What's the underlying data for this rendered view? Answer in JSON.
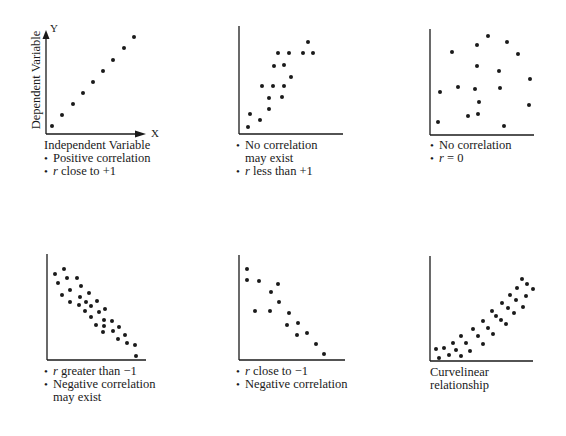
{
  "chart_data": [
    {
      "id": "positive",
      "type": "scatter",
      "title": "",
      "xlabel": "Independent Variable",
      "ylabel": "Dependent Variable",
      "x_axis_letter": "X",
      "y_axis_letter": "Y",
      "arrows": true,
      "grid": false,
      "axes": {
        "origin": [
          46,
          134
        ],
        "top": 30,
        "right": 146
      },
      "points": [
        [
          52,
          126
        ],
        [
          62,
          115
        ],
        [
          73,
          104
        ],
        [
          83,
          93
        ],
        [
          93,
          82
        ],
        [
          103,
          71
        ],
        [
          113,
          60
        ],
        [
          124,
          48
        ],
        [
          134,
          37
        ]
      ],
      "caption": [
        {
          "text": "Independent Variable",
          "bullet": false
        },
        {
          "text": "Positive correlation",
          "bullet": true
        },
        {
          "prefix": "r",
          "text": " close to +1",
          "bullet": true
        }
      ],
      "caption_pos": [
        44,
        139
      ]
    },
    {
      "id": "weak-positive",
      "type": "scatter",
      "title": "",
      "grid": false,
      "axes": {
        "origin": [
          239,
          134
        ],
        "top": 26,
        "right": 343
      },
      "points": [
        [
          248,
          127
        ],
        [
          250,
          114
        ],
        [
          260,
          120
        ],
        [
          269,
          109
        ],
        [
          269,
          98
        ],
        [
          262,
          86
        ],
        [
          273,
          86
        ],
        [
          282,
          97
        ],
        [
          284,
          86
        ],
        [
          291,
          77
        ],
        [
          274,
          66
        ],
        [
          284,
          65
        ],
        [
          278,
          53
        ],
        [
          289,
          53
        ],
        [
          303,
          53
        ],
        [
          313,
          53
        ],
        [
          308,
          42
        ]
      ],
      "caption": [
        {
          "text": "No correlation",
          "bullet": true
        },
        {
          "text": "may exist",
          "bullet": false,
          "indent": true
        },
        {
          "prefix": "r",
          "text": " less than +1",
          "bullet": true
        }
      ],
      "caption_pos": [
        236,
        139
      ]
    },
    {
      "id": "no-correlation",
      "type": "scatter",
      "title": "",
      "grid": false,
      "axes": {
        "origin": [
          430,
          135
        ],
        "top": 29,
        "right": 534
      },
      "points": [
        [
          488,
          36
        ],
        [
          507,
          42
        ],
        [
          477,
          45
        ],
        [
          452,
          52
        ],
        [
          518,
          54
        ],
        [
          477,
          66
        ],
        [
          499,
          71
        ],
        [
          530,
          79
        ],
        [
          440,
          92
        ],
        [
          458,
          87
        ],
        [
          475,
          89
        ],
        [
          500,
          88
        ],
        [
          479,
          102
        ],
        [
          529,
          105
        ],
        [
          468,
          116
        ],
        [
          478,
          114
        ],
        [
          438,
          122
        ],
        [
          504,
          126
        ]
      ],
      "caption": [
        {
          "text": "No correlation",
          "bullet": true
        },
        {
          "prefix": "r",
          "text": " = 0",
          "bullet": true
        }
      ],
      "caption_pos": [
        430,
        139
      ]
    },
    {
      "id": "weak-negative",
      "type": "scatter",
      "title": "",
      "grid": false,
      "axes": {
        "origin": [
          47,
          360
        ],
        "top": 254,
        "right": 146
      },
      "points": [
        [
          55,
          274
        ],
        [
          64,
          269
        ],
        [
          58,
          283
        ],
        [
          67,
          278
        ],
        [
          77,
          278
        ],
        [
          62,
          295
        ],
        [
          70,
          290
        ],
        [
          81,
          286
        ],
        [
          70,
          302
        ],
        [
          80,
          297
        ],
        [
          89,
          293
        ],
        [
          79,
          305
        ],
        [
          86,
          302
        ],
        [
          97,
          301
        ],
        [
          85,
          311
        ],
        [
          91,
          306
        ],
        [
          99,
          312
        ],
        [
          105,
          309
        ],
        [
          91,
          317
        ],
        [
          104,
          320
        ],
        [
          112,
          321
        ],
        [
          96,
          325
        ],
        [
          104,
          326
        ],
        [
          119,
          327
        ],
        [
          103,
          332
        ],
        [
          113,
          331
        ],
        [
          125,
          335
        ],
        [
          118,
          339
        ],
        [
          127,
          343
        ],
        [
          135,
          345
        ],
        [
          136,
          356
        ]
      ],
      "caption": [
        {
          "prefix": "r",
          "text": " greater than −1",
          "bullet": true
        },
        {
          "text": "Negative correlation",
          "bullet": true
        },
        {
          "text": "may exist",
          "bullet": false,
          "indent": true
        }
      ],
      "caption_pos": [
        44,
        365
      ]
    },
    {
      "id": "strong-negative",
      "type": "scatter",
      "title": "",
      "grid": false,
      "axes": {
        "origin": [
          239,
          360
        ],
        "top": 255,
        "right": 345
      },
      "points": [
        [
          247,
          269
        ],
        [
          247,
          280
        ],
        [
          259,
          281
        ],
        [
          278,
          284
        ],
        [
          271,
          292
        ],
        [
          279,
          302
        ],
        [
          255,
          311
        ],
        [
          270,
          311
        ],
        [
          289,
          313
        ],
        [
          287,
          325
        ],
        [
          298,
          323
        ],
        [
          297,
          335
        ],
        [
          307,
          333
        ],
        [
          316,
          344
        ],
        [
          324,
          354
        ]
      ],
      "caption": [
        {
          "prefix": "r",
          "text": " close to −1",
          "bullet": true
        },
        {
          "text": "Negative correlation",
          "bullet": true
        }
      ],
      "caption_pos": [
        236,
        365
      ]
    },
    {
      "id": "curvilinear",
      "type": "scatter",
      "title": "",
      "grid": false,
      "axes": {
        "origin": [
          430,
          361
        ],
        "top": 256,
        "right": 533
      },
      "points": [
        [
          436,
          349
        ],
        [
          439,
          358
        ],
        [
          444,
          348
        ],
        [
          449,
          355
        ],
        [
          453,
          343
        ],
        [
          456,
          350
        ],
        [
          461,
          356
        ],
        [
          461,
          336
        ],
        [
          466,
          343
        ],
        [
          470,
          351
        ],
        [
          473,
          329
        ],
        [
          478,
          336
        ],
        [
          483,
          344
        ],
        [
          483,
          321
        ],
        [
          488,
          328
        ],
        [
          493,
          334
        ],
        [
          492,
          311
        ],
        [
          496,
          316
        ],
        [
          501,
          320
        ],
        [
          506,
          324
        ],
        [
          502,
          303
        ],
        [
          508,
          308
        ],
        [
          514,
          313
        ],
        [
          510,
          295
        ],
        [
          516,
          300
        ],
        [
          523,
          307
        ],
        [
          517,
          288
        ],
        [
          526,
          296
        ],
        [
          522,
          279
        ],
        [
          527,
          284
        ],
        [
          533,
          289
        ]
      ],
      "caption": [
        {
          "text": "Curvelinear",
          "bullet": false
        },
        {
          "text": "relationship",
          "bullet": false
        }
      ],
      "caption_pos": [
        430,
        366
      ]
    }
  ],
  "style": {
    "ink": "#1a1a1a",
    "background": "#ffffff",
    "dot_radius": 2
  },
  "labels": {
    "y_axis_title": "Dependent Variable",
    "x_letter": "X",
    "y_letter": "Y"
  }
}
